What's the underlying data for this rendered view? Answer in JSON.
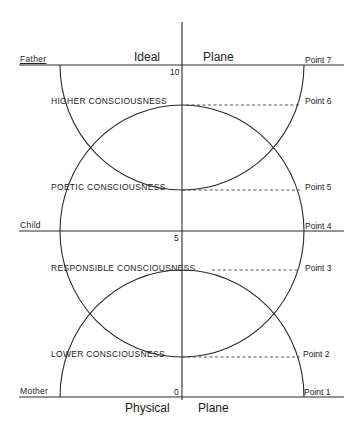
{
  "diagram": {
    "planes": {
      "top_left": "Ideal",
      "top_right": "Plane",
      "bottom_left": "Physical",
      "bottom_right": "Plane"
    },
    "left_labels": {
      "top": "Father",
      "middle": "Child",
      "bottom": "Mother"
    },
    "axis_ticks": {
      "top": "10",
      "middle": "5",
      "bottom": "0"
    },
    "levels": [
      {
        "label": "HIGHER CONSCIOUSNESS",
        "point": "Point 6"
      },
      {
        "label": "POETIC CONSCIOUSNESS",
        "point": "Point 5"
      },
      {
        "label": "RESPONSIBLE CONSCIOUSNESS",
        "point": "Point 3"
      },
      {
        "label": "LOWER CONSCIOUSNESS",
        "point": "Point 2"
      }
    ],
    "points": {
      "p7": "Point 7",
      "p4": "Point 4",
      "p1": "Point 1"
    },
    "line_color": "#2a2a2a"
  }
}
